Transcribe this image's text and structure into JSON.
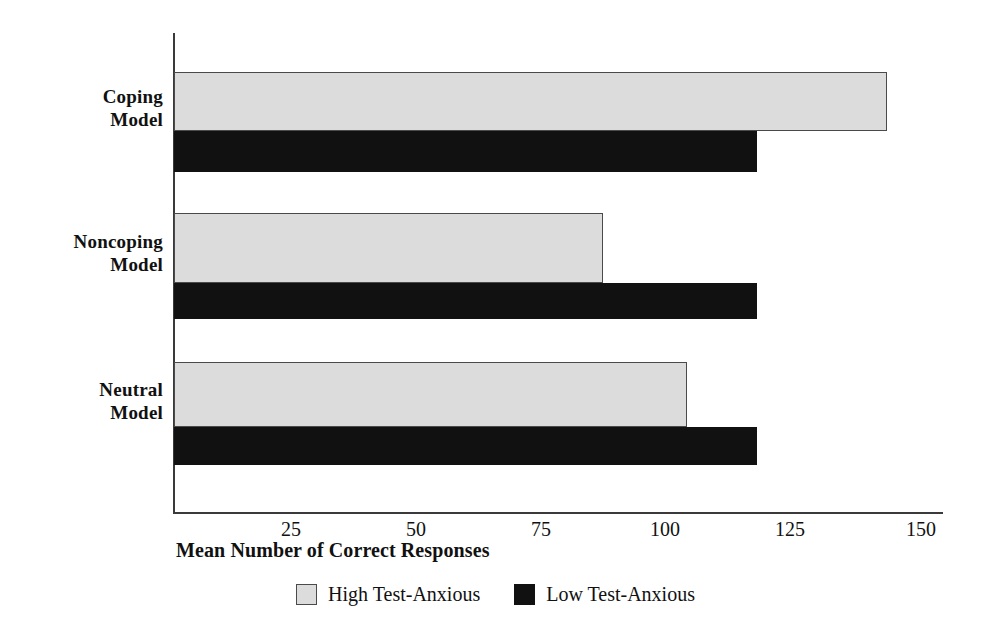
{
  "chart_data": {
    "type": "bar",
    "orientation": "horizontal",
    "title": "",
    "xlabel": "Mean Number of Correct Responses",
    "ylabel": "",
    "categories": [
      "Coping Model",
      "Noncoping Model",
      "Neutral Model"
    ],
    "category_lines": [
      [
        "Coping",
        "Model"
      ],
      [
        "Noncoping",
        "Model"
      ],
      [
        "Neutral",
        "Model"
      ]
    ],
    "series": [
      {
        "name": "High Test-Anxious",
        "color": "#dcdcdc",
        "values": [
          143,
          86,
          103
        ]
      },
      {
        "name": "Low Test-Anxious",
        "color": "#111111",
        "values": [
          117,
          117,
          117
        ]
      }
    ],
    "xlim": [
      0,
      157
    ],
    "xticks": [
      25,
      50,
      75,
      100,
      125,
      150
    ],
    "xtick_labels": [
      "25",
      "50",
      "75",
      "100",
      "125",
      "150"
    ],
    "grid": false,
    "legend_position": "bottom"
  },
  "axis": {
    "x_title": "Mean Number of Correct Responses"
  },
  "legend": {
    "items": [
      {
        "label": "High Test-Anxious",
        "swatch": "light-gray-swatch"
      },
      {
        "label": "Low Test-Anxious",
        "swatch": "black-swatch"
      }
    ]
  },
  "geometry": {
    "x0_px": 174,
    "px_per_unit": 4.985,
    "groups": [
      {
        "high_top": 72,
        "high_height": 59,
        "low_top": 131,
        "low_height": 41
      },
      {
        "high_top": 213,
        "high_height": 70,
        "low_top": 283,
        "low_height": 36
      },
      {
        "high_top": 362,
        "high_height": 65,
        "low_top": 427,
        "low_height": 38
      }
    ],
    "label_tops": [
      85,
      230,
      378
    ],
    "tick_positions_px": [
      291,
      416,
      541,
      665,
      790,
      921
    ]
  }
}
